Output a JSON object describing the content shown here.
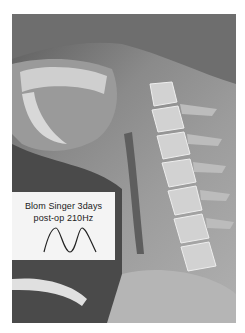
{
  "image": {
    "subject": "lateral cervical spine x-ray",
    "colors": {
      "background": "#ffffff",
      "label_background": "#f4f4f4",
      "text": "#222222"
    }
  },
  "label": {
    "line1": "Blom Singer  3days",
    "line2": "post-op  210Hz",
    "waveform": "two-peak periodic waveform"
  }
}
